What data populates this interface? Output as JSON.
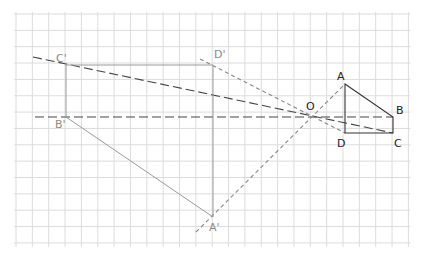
{
  "diagram": {
    "title": "",
    "grid": {
      "x0": 16,
      "y0": 14,
      "spacing": 16.35,
      "cols": 24,
      "rows": 14,
      "color": "#dcdcdc"
    },
    "colors": {
      "original": "#333333",
      "image": "#9a9a9a",
      "ray_dark": "#444444",
      "ray_light": "#888888"
    },
    "points": {
      "A": {
        "x": 345,
        "y": 84,
        "label": "A"
      },
      "B": {
        "x": 393,
        "y": 117,
        "label": "B"
      },
      "C": {
        "x": 393,
        "y": 133,
        "label": "C"
      },
      "D": {
        "x": 345,
        "y": 133,
        "label": "D"
      },
      "O": {
        "x": 313,
        "y": 117,
        "label": "O"
      },
      "A1": {
        "x": 213,
        "y": 217,
        "label": "A'"
      },
      "B1": {
        "x": 66,
        "y": 117,
        "label": "B'"
      },
      "C1": {
        "x": 66,
        "y": 65,
        "label": "C'"
      },
      "D1": {
        "x": 213,
        "y": 65,
        "label": "D'"
      }
    },
    "labels": [
      {
        "key": "A",
        "text": "A",
        "x": 337,
        "y": 80,
        "color": "#222222"
      },
      {
        "key": "B",
        "text": "B",
        "x": 396,
        "y": 114,
        "color": "#222222"
      },
      {
        "key": "C",
        "text": "C",
        "x": 394,
        "y": 147,
        "color": "#222222"
      },
      {
        "key": "D",
        "text": "D",
        "x": 337,
        "y": 147,
        "color": "#222222"
      },
      {
        "key": "O",
        "text": "O",
        "x": 306,
        "y": 110,
        "color": "#222222"
      },
      {
        "key": "A1",
        "text": "A'",
        "x": 209,
        "y": 231,
        "color": "#8a8a8a"
      },
      {
        "key": "B1",
        "text": "B'",
        "x": 55,
        "y": 128,
        "color": "#8a8a8a"
      },
      {
        "key": "C1",
        "text": "C'",
        "x": 56,
        "y": 62,
        "color": "#8a8a8a"
      },
      {
        "key": "D1",
        "text": "D'",
        "x": 214,
        "y": 58,
        "color": "#8a8a8a"
      }
    ],
    "original_shape": {
      "name": "ABCD",
      "vertices": [
        "A",
        "B",
        "C",
        "D"
      ]
    },
    "image_shape": {
      "name": "A'B'C'D'",
      "vertices": [
        "A1",
        "B1",
        "C1",
        "D1"
      ]
    },
    "rays": [
      {
        "name": "ray-c-cprime",
        "from": [
          33,
          57
        ],
        "to": [
          393,
          133
        ],
        "dash": "9,4",
        "color": "#444444"
      },
      {
        "name": "ray-b-bprime",
        "from": [
          35,
          117
        ],
        "to": [
          393,
          117
        ],
        "dash": "9,4",
        "color": "#444444"
      },
      {
        "name": "ray-d-dprime",
        "from": [
          200,
          59
        ],
        "to": [
          345,
          133
        ],
        "dash": "4,3",
        "color": "#888888"
      },
      {
        "name": "ray-a-aprime",
        "from": [
          196,
          232
        ],
        "to": [
          345,
          84
        ],
        "dash": "4,3",
        "color": "#888888"
      }
    ]
  }
}
